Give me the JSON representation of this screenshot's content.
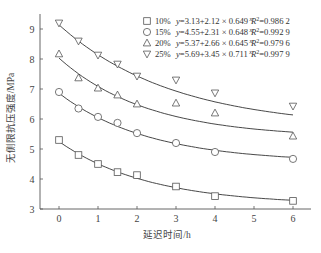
{
  "chart_data": {
    "type": "scatter",
    "title": "",
    "xlabel": "延迟时间/h",
    "ylabel": "无侧限抗压强度/MPa",
    "xlim": [
      -0.4,
      6.4
    ],
    "ylim": [
      3,
      9.5
    ],
    "xticks": [
      0,
      1,
      2,
      3,
      4,
      5,
      6
    ],
    "yticks": [
      3,
      4,
      5,
      6,
      7,
      8,
      9
    ],
    "grid": false,
    "legend_position": "upper right",
    "x": [
      0,
      0.5,
      1,
      1.5,
      2,
      3,
      4,
      6
    ],
    "series": [
      {
        "name": "10%",
        "marker": "square",
        "values": [
          5.3,
          4.8,
          4.5,
          4.23,
          4.13,
          3.75,
          3.43,
          3.27
        ],
        "fit": {
          "a": 3.13,
          "b": 2.12,
          "c": 0.649
        },
        "equation": "y=3.13+2.12 × 0.649",
        "exponent": "x",
        "r2_label": "R",
        "r2_value": "=0.986 2"
      },
      {
        "name": "15%",
        "marker": "circle",
        "values": [
          6.9,
          6.35,
          6.07,
          5.87,
          5.53,
          5.2,
          4.9,
          4.67
        ],
        "fit": {
          "a": 4.55,
          "b": 2.31,
          "c": 0.648
        },
        "equation": "y=4.55+2.31 × 0.648",
        "exponent": "x",
        "r2_label": "R",
        "r2_value": "=0.992 9"
      },
      {
        "name": "20%",
        "marker": "triangle-up",
        "values": [
          8.17,
          7.37,
          7.03,
          6.8,
          6.5,
          6.53,
          6.2,
          5.43
        ],
        "fit": {
          "a": 5.37,
          "b": 2.66,
          "c": 0.645
        },
        "equation": "y=5.37+2.66 × 0.645",
        "exponent": "x",
        "r2_label": "R",
        "r2_value": "=0.979 6"
      },
      {
        "name": "25%",
        "marker": "triangle-down",
        "values": [
          9.2,
          8.6,
          8.13,
          7.83,
          7.43,
          7.3,
          6.87,
          6.43
        ],
        "fit": {
          "a": 5.69,
          "b": 3.45,
          "c": 0.711
        },
        "equation": "y=5.69+3.45 × 0.711",
        "exponent": "x",
        "r2_label": "R",
        "r2_value": "=0.997 9"
      }
    ]
  }
}
